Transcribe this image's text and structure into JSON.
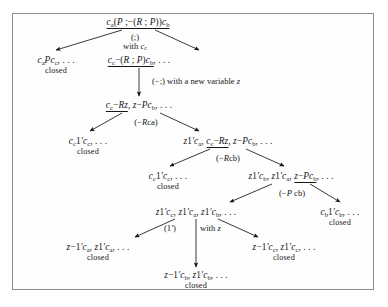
{
  "figure": {
    "type": "semantic-tableau-proof-tree",
    "border_color": "#8a8d92",
    "text_color": "#15161a",
    "nodes": [
      {
        "id": "n0",
        "label": "c_a(P ;−(R ; P))c_b",
        "underlined": "c_a(P ;−(R ; P))c_b",
        "closed": ""
      },
      {
        "id": "n1",
        "label": "c_a P c_c, . . .",
        "underlined": "",
        "closed": "closed"
      },
      {
        "id": "n2",
        "label": "c_c−(R ; P)c_b, . . .",
        "underlined": "c_c−(R ; P)c_b",
        "closed": ""
      },
      {
        "id": "n3",
        "label": "c_c−Rz, z−Pc_b, . . .",
        "underlined": "c_c−Rz",
        "closed": ""
      },
      {
        "id": "n4",
        "label": "c_c1'c_c, . . .",
        "underlined": "",
        "closed": "closed"
      },
      {
        "id": "n5",
        "label": "z1'c_a, c_c−Rz, z−Pc_b, . . .",
        "underlined": "c_c−Rz",
        "closed": ""
      },
      {
        "id": "n6",
        "label": "c_c1'c_c, . . .",
        "underlined": "",
        "closed": "closed"
      },
      {
        "id": "n7",
        "label": "z1'c_b, z1'c_a, z−Pc_b, . . .",
        "underlined": "z−Pc_b",
        "closed": ""
      },
      {
        "id": "n8",
        "label": "z1'c_c, z1'c_a, z1'c_b, . . .",
        "underlined": "",
        "closed": ""
      },
      {
        "id": "n9",
        "label": "c_b1'c_b, . . .",
        "underlined": "",
        "closed": "closed"
      },
      {
        "id": "n10",
        "label": "z−1'c_a, z1'c_a, . . .",
        "underlined": "",
        "closed": "closed"
      },
      {
        "id": "n11",
        "label": "z−1'c_c, z1'c_c, . . .",
        "underlined": "",
        "closed": "closed"
      },
      {
        "id": "n12",
        "label": "z−1'c_b, z1'c_b, . . .",
        "underlined": "",
        "closed": "closed"
      }
    ],
    "edge_labels": [
      {
        "id": "e0",
        "line1": "(;)",
        "line2": "with c_c"
      },
      {
        "id": "e1",
        "line1": "(−;) with a new variable z",
        "line2": ""
      },
      {
        "id": "e2",
        "line1": "(−Rca)",
        "line2": ""
      },
      {
        "id": "e3",
        "line1": "(−Rcb)",
        "line2": ""
      },
      {
        "id": "e4",
        "line1": "(−Pcb)",
        "line2": ""
      },
      {
        "id": "e5",
        "line1": "(1')",
        "line2": "with z"
      }
    ],
    "closed_word": "closed"
  }
}
